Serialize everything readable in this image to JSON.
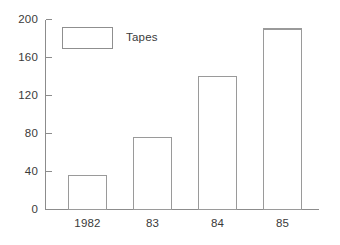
{
  "chart_data": {
    "type": "bar",
    "title": "",
    "subtitle": "",
    "xlabel": "",
    "ylabel": "",
    "categories": [
      "1982",
      "83",
      "84",
      "85"
    ],
    "values": [
      36,
      76,
      140,
      190
    ],
    "series": [
      {
        "name": "Tapes",
        "values": [
          36,
          76,
          140,
          190
        ]
      }
    ],
    "ylim": [
      0,
      200
    ],
    "yticks": [
      0,
      40,
      80,
      120,
      160,
      200
    ],
    "ytick_labels": [
      "0",
      "40",
      "80",
      "120",
      "160",
      "200"
    ],
    "grid": false,
    "legend": {
      "position": "top-left-inside",
      "entries": [
        {
          "label": "Tapes",
          "fill": "#ffffff",
          "border": "#8f8f8f"
        }
      ]
    },
    "style": {
      "bar_fill": "#ffffff",
      "bar_border": "#9a9a9a",
      "axis_color": "#8c8c8c",
      "text_color": "#3a3a3a",
      "background": "#ffffff"
    }
  }
}
